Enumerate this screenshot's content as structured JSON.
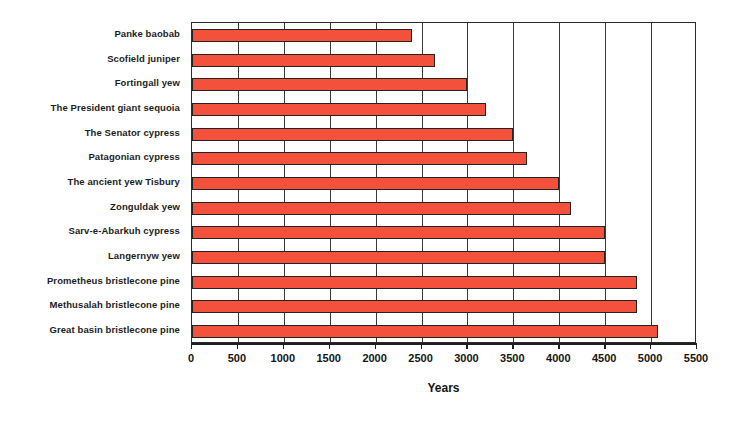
{
  "chart_data": {
    "type": "bar",
    "orientation": "horizontal",
    "title": "",
    "xlabel": "Years",
    "ylabel": "",
    "xlim": [
      0,
      5500
    ],
    "xticks": [
      0,
      500,
      1000,
      1500,
      2000,
      2500,
      3000,
      3500,
      4000,
      4500,
      5000,
      5500
    ],
    "xtick_labels": [
      "0",
      "500",
      "1000",
      "1500",
      "2000",
      "2500",
      "3000",
      "3500",
      "4000",
      "4500",
      "5000",
      "5500"
    ],
    "grid": "vertical",
    "legend": "none",
    "bar_color": "#f4513c",
    "bar_edge_color": "#232323",
    "categories": [
      "Panke baobab",
      "Scofield juniper",
      "Fortingall yew",
      "The President giant sequoia",
      "The Senator cypress",
      "Patagonian cypress",
      "The ancient yew Tisbury",
      "Zonguldak yew",
      "Sarv-e-Abarkuh cypress",
      "Langernyw yew",
      "Prometheus bristlecone pine",
      "Methusalah bristlecone pine",
      "Great basin bristlecone pine"
    ],
    "values": [
      2400,
      2650,
      3000,
      3200,
      3500,
      3650,
      4000,
      4130,
      4500,
      4500,
      4850,
      4850,
      5080
    ]
  }
}
